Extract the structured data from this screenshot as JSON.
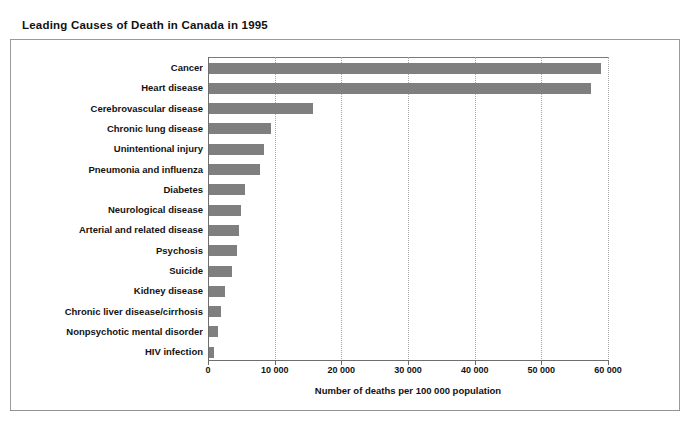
{
  "figure": {
    "title": "Leading Causes of Death in Canada in 1995"
  },
  "chart_data": {
    "type": "bar",
    "orientation": "horizontal",
    "title": "Leading Causes of Death in Canada in 1995",
    "xlabel": "Number of deaths per 100 000 population",
    "ylabel": "",
    "xlim": [
      0,
      60000
    ],
    "xticks": [
      0,
      10000,
      20000,
      30000,
      40000,
      50000,
      60000
    ],
    "xtick_labels": [
      "0",
      "10 000",
      "20 000",
      "30 000",
      "40 000",
      "50 000",
      "60 000"
    ],
    "grid": "vertical-dotted",
    "legend": null,
    "bar_color": "#7f7f7f",
    "categories": [
      "Cancer",
      "Heart disease",
      "Cerebrovascular disease",
      "Chronic lung disease",
      "Unintentional injury",
      "Pneumonia and influenza",
      "Diabetes",
      "Neurological disease",
      "Arterial and related disease",
      "Psychosis",
      "Suicide",
      "Kidney disease",
      "Chronic liver disease/cirrhosis",
      "Nonpsychotic mental disorder",
      "HIV infection"
    ],
    "values": [
      58800,
      57300,
      15600,
      9300,
      8200,
      7600,
      5400,
      4800,
      4500,
      4200,
      3500,
      2400,
      1800,
      1300,
      800
    ]
  }
}
